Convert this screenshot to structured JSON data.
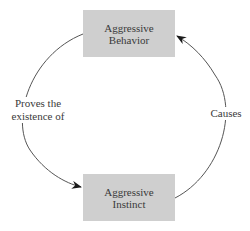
{
  "diagram": {
    "type": "cycle",
    "nodes": [
      {
        "id": "behavior",
        "line1": "Aggressive",
        "line2": "Behavior"
      },
      {
        "id": "instinct",
        "line1": "Aggressive",
        "line2": "Instinct"
      }
    ],
    "edges": [
      {
        "from": "behavior",
        "to": "instinct",
        "label_line1": "Proves the",
        "label_line2": "existence of"
      },
      {
        "from": "instinct",
        "to": "behavior",
        "label": "Causes"
      }
    ],
    "colors": {
      "node_fill": "#cfcfcf",
      "line": "#555555",
      "text": "#3a3a3a"
    }
  }
}
